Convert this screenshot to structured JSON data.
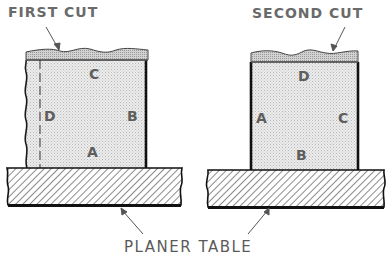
{
  "labels": {
    "first_cut": "FIRST CUT",
    "second_cut": "SECOND CUT",
    "planer_table": "PLANER TABLE"
  },
  "left_view": {
    "faces": {
      "top": "C",
      "left": "D",
      "right": "B",
      "bottom": "A"
    }
  },
  "right_view": {
    "faces": {
      "top": "D",
      "left": "A",
      "right": "C",
      "bottom": "B"
    }
  },
  "colors": {
    "stock_fill": "#e4e4e4",
    "cut_strip_fill": "#c8c8c8",
    "outline": "#1a1a1a",
    "label_gray": "#6a6a6a",
    "hatch": "#2a2a2a"
  }
}
